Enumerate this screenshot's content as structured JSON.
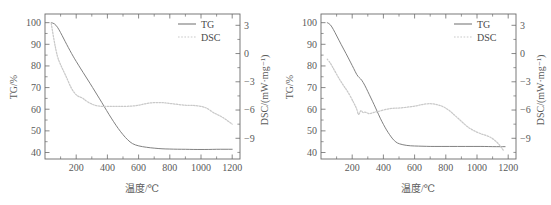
{
  "figure": {
    "panels": [
      {
        "id": "panel-a",
        "legend": {
          "tg": "TG",
          "dsc": "DSC"
        },
        "axes": {
          "x": {
            "title": "温度/℃",
            "ticks": [
              "200",
              "400",
              "600",
              "800",
              "1000",
              "1200"
            ],
            "min": 0,
            "max": 1250
          },
          "y_left": {
            "title": "TG/%",
            "ticks": [
              "100",
              "90",
              "80",
              "70",
              "60",
              "50",
              "40"
            ],
            "min": 37,
            "max": 104
          },
          "y_right": {
            "title": "DSC/(mW·mg⁻¹)",
            "ticks": [
              "3",
              "0",
              "-3",
              "-6",
              "-9"
            ],
            "min": -11.2,
            "max": 4.2
          }
        }
      },
      {
        "id": "panel-b",
        "legend": {
          "tg": "TG",
          "dsc": "DSC"
        },
        "axes": {
          "x": {
            "title": "温度/℃",
            "ticks": [
              "200",
              "400",
              "600",
              "800",
              "1000",
              "1200"
            ],
            "min": 0,
            "max": 1250
          },
          "y_left": {
            "title": "TG/%",
            "ticks": [
              "100",
              "90",
              "80",
              "70",
              "60",
              "50",
              "40"
            ],
            "min": 37,
            "max": 104
          },
          "y_right": {
            "title": "DSC/(mW·mg⁻¹)",
            "ticks": [
              "3",
              "0",
              "-3",
              "-6",
              "-9"
            ],
            "min": -11.2,
            "max": 4.2
          }
        }
      }
    ],
    "colors": {
      "tg_line": "#7a7a7a",
      "dsc_line": "#c9c9c9",
      "axis": "#6b6b6b",
      "text": "#5a5a5a"
    }
  },
  "chart_data": [
    {
      "type": "line",
      "title": "",
      "panel": "panel-a",
      "xlabel": "温度/℃",
      "ylabel": "TG/%",
      "y2label": "DSC/(mW·mg⁻¹)",
      "xlim": [
        0,
        1250
      ],
      "ylim": [
        37,
        104
      ],
      "y2lim": [
        -11.2,
        4.2
      ],
      "xticks": [
        200,
        400,
        600,
        800,
        1000,
        1200
      ],
      "yticks": [
        40,
        50,
        60,
        70,
        80,
        90,
        100
      ],
      "y2ticks": [
        -9,
        -6,
        -3,
        0,
        3
      ],
      "grid": false,
      "legend": [
        "TG",
        "DSC"
      ],
      "legend_position": "top-right",
      "series": [
        {
          "name": "TG",
          "axis": "left",
          "style": "solid",
          "x": [
            40,
            60,
            80,
            100,
            120,
            140,
            160,
            180,
            200,
            230,
            260,
            290,
            320,
            350,
            380,
            410,
            440,
            470,
            500,
            530,
            560,
            600,
            650,
            700,
            750,
            800,
            850,
            900,
            950,
            1000,
            1050,
            1100,
            1150,
            1200
          ],
          "y": [
            100.0,
            99.6,
            98.0,
            95.4,
            92.6,
            89.8,
            87.1,
            84.5,
            82.1,
            78.6,
            75.2,
            71.8,
            68.3,
            64.8,
            61.2,
            57.6,
            54.2,
            51.0,
            48.2,
            45.8,
            44.0,
            43.0,
            42.4,
            42.0,
            41.7,
            41.6,
            41.5,
            41.5,
            41.4,
            41.4,
            41.4,
            41.5,
            41.5,
            41.5
          ]
        },
        {
          "name": "DSC",
          "axis": "right",
          "style": "dotted",
          "x": [
            40,
            60,
            80,
            100,
            120,
            140,
            160,
            180,
            200,
            220,
            240,
            260,
            290,
            320,
            350,
            380,
            420,
            460,
            500,
            550,
            600,
            650,
            700,
            750,
            800,
            850,
            900,
            950,
            1000,
            1040,
            1080,
            1120,
            1160,
            1200
          ],
          "y": [
            3.2,
            1.2,
            -0.4,
            -1.2,
            -1.9,
            -2.6,
            -3.4,
            -4.0,
            -4.4,
            -4.6,
            -4.7,
            -5.0,
            -5.3,
            -5.5,
            -5.6,
            -5.6,
            -5.6,
            -5.6,
            -5.6,
            -5.6,
            -5.5,
            -5.3,
            -5.2,
            -5.2,
            -5.3,
            -5.4,
            -5.5,
            -5.5,
            -5.6,
            -5.8,
            -6.3,
            -6.6,
            -7.0,
            -7.5
          ]
        }
      ]
    },
    {
      "type": "line",
      "title": "",
      "panel": "panel-b",
      "xlabel": "温度/℃",
      "ylabel": "TG/%",
      "y2label": "DSC/(mW·mg⁻¹)",
      "xlim": [
        0,
        1250
      ],
      "ylim": [
        37,
        104
      ],
      "y2lim": [
        -11.2,
        4.2
      ],
      "xticks": [
        200,
        400,
        600,
        800,
        1000,
        1200
      ],
      "yticks": [
        40,
        50,
        60,
        70,
        80,
        90,
        100
      ],
      "y2ticks": [
        -9,
        -6,
        -3,
        0,
        3
      ],
      "grid": false,
      "legend": [
        "TG",
        "DSC"
      ],
      "legend_position": "top-right",
      "series": [
        {
          "name": "TG",
          "axis": "left",
          "style": "solid",
          "x": [
            40,
            60,
            80,
            100,
            130,
            160,
            190,
            210,
            230,
            245,
            260,
            280,
            300,
            320,
            340,
            360,
            380,
            400,
            420,
            440,
            460,
            480,
            500,
            550,
            600,
            650,
            700,
            750,
            800,
            850,
            900,
            950,
            1000,
            1050,
            1100,
            1150,
            1180
          ],
          "y": [
            100.0,
            99.2,
            96.8,
            94.0,
            89.8,
            85.8,
            81.6,
            78.8,
            75.8,
            74.6,
            73.6,
            71.2,
            68.2,
            65.2,
            62.2,
            59.0,
            55.8,
            53.0,
            50.4,
            48.2,
            46.2,
            44.8,
            44.0,
            43.2,
            43.0,
            42.9,
            42.8,
            42.8,
            42.8,
            42.8,
            42.8,
            42.8,
            42.8,
            42.8,
            42.7,
            42.7,
            42.7
          ]
        },
        {
          "name": "DSC",
          "axis": "right",
          "style": "dotted",
          "x": [
            40,
            60,
            80,
            110,
            140,
            170,
            200,
            215,
            230,
            240,
            250,
            258,
            268,
            280,
            295,
            310,
            330,
            350,
            380,
            420,
            460,
            500,
            550,
            600,
            650,
            700,
            740,
            780,
            820,
            860,
            900,
            940,
            980,
            1020,
            1060,
            1100,
            1140,
            1170
          ],
          "y": [
            -0.6,
            -1.0,
            -1.6,
            -2.5,
            -3.3,
            -4.0,
            -4.9,
            -5.4,
            -5.9,
            -6.6,
            -6.2,
            -6.0,
            -6.3,
            -6.2,
            -6.3,
            -6.4,
            -6.3,
            -6.2,
            -6.1,
            -5.9,
            -5.8,
            -5.8,
            -5.7,
            -5.6,
            -5.4,
            -5.3,
            -5.4,
            -5.6,
            -6.0,
            -6.6,
            -7.2,
            -7.8,
            -8.2,
            -8.5,
            -8.7,
            -9.0,
            -9.6,
            -10.3
          ]
        }
      ]
    }
  ]
}
